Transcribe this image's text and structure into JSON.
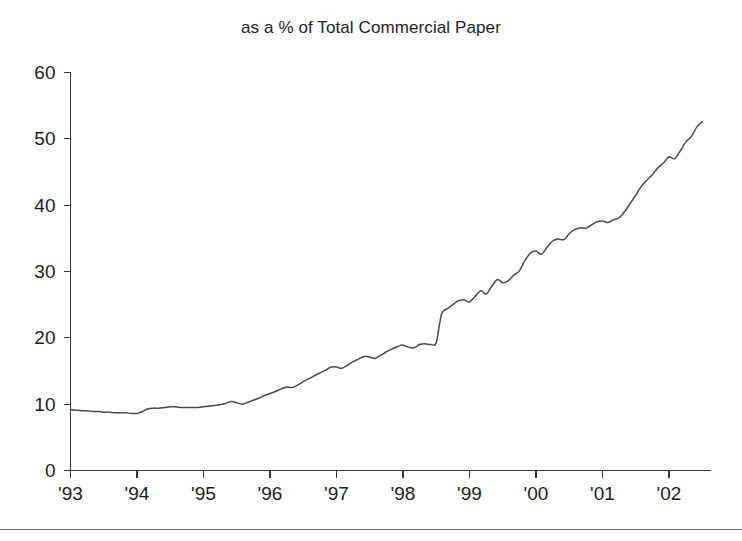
{
  "chart_data": {
    "type": "line",
    "title": "as a % of Total Commercial Paper",
    "subtitle": "",
    "xlabel": "",
    "ylabel": "",
    "grid": false,
    "legend": "none",
    "ylim": [
      0,
      60
    ],
    "xlim": [
      1993.0,
      2002.6
    ],
    "yticks": [
      0,
      10,
      20,
      30,
      40,
      50,
      60
    ],
    "ytick_labels": [
      "0",
      "10",
      "20",
      "30",
      "40",
      "50",
      "60"
    ],
    "xticks": [
      1993,
      1994,
      1995,
      1996,
      1997,
      1998,
      1999,
      2000,
      2001,
      2002
    ],
    "xtick_labels": [
      "'93",
      "'94",
      "'95",
      "'96",
      "'97",
      "'98",
      "'99",
      "'00",
      "'01",
      "'02"
    ],
    "line_color": "#4a4a4a",
    "axis_color": "#3a3a3a",
    "series": [
      {
        "name": "Asset-backed commercial paper as a % of total commercial paper",
        "x": [
          1993.0,
          1993.08,
          1993.17,
          1993.25,
          1993.33,
          1993.42,
          1993.5,
          1993.58,
          1993.67,
          1993.75,
          1993.83,
          1993.92,
          1994.0,
          1994.08,
          1994.17,
          1994.25,
          1994.33,
          1994.42,
          1994.5,
          1994.58,
          1994.67,
          1994.75,
          1994.83,
          1994.92,
          1995.0,
          1995.08,
          1995.17,
          1995.25,
          1995.33,
          1995.42,
          1995.5,
          1995.58,
          1995.67,
          1995.75,
          1995.83,
          1995.92,
          1996.0,
          1996.08,
          1996.17,
          1996.25,
          1996.33,
          1996.42,
          1996.5,
          1996.58,
          1996.67,
          1996.75,
          1996.83,
          1996.92,
          1997.0,
          1997.08,
          1997.17,
          1997.25,
          1997.33,
          1997.42,
          1997.5,
          1997.58,
          1997.67,
          1997.75,
          1997.83,
          1997.92,
          1998.0,
          1998.08,
          1998.17,
          1998.25,
          1998.33,
          1998.42,
          1998.5,
          1998.58,
          1998.67,
          1998.75,
          1998.83,
          1998.92,
          1999.0,
          1999.08,
          1999.17,
          1999.25,
          1999.33,
          1999.42,
          1999.5,
          1999.58,
          1999.67,
          1999.75,
          1999.83,
          1999.92,
          2000.0,
          2000.08,
          2000.17,
          2000.25,
          2000.33,
          2000.42,
          2000.5,
          2000.58,
          2000.67,
          2000.75,
          2000.83,
          2000.92,
          2001.0,
          2001.08,
          2001.17,
          2001.25,
          2001.33,
          2001.42,
          2001.5,
          2001.58,
          2001.67,
          2001.75,
          2001.83,
          2001.92,
          2002.0,
          2002.08,
          2002.17,
          2002.25,
          2002.33,
          2002.42,
          2002.5
        ],
        "values": [
          9.2,
          9.1,
          9.0,
          9.0,
          8.9,
          8.9,
          8.8,
          8.8,
          8.7,
          8.7,
          8.7,
          8.6,
          8.6,
          8.9,
          9.3,
          9.4,
          9.4,
          9.5,
          9.6,
          9.6,
          9.5,
          9.5,
          9.5,
          9.5,
          9.6,
          9.7,
          9.8,
          9.9,
          10.1,
          10.4,
          10.2,
          10.0,
          10.3,
          10.6,
          10.9,
          11.3,
          11.6,
          11.9,
          12.3,
          12.6,
          12.5,
          12.9,
          13.4,
          13.8,
          14.3,
          14.7,
          15.1,
          15.6,
          15.6,
          15.4,
          15.9,
          16.4,
          16.8,
          17.2,
          17.1,
          16.9,
          17.4,
          17.9,
          18.3,
          18.7,
          18.9,
          18.6,
          18.5,
          19.0,
          19.1,
          19.0,
          19.3,
          23.6,
          24.4,
          25.0,
          25.6,
          25.7,
          25.4,
          26.2,
          27.1,
          26.6,
          27.7,
          28.8,
          28.3,
          28.6,
          29.5,
          30.1,
          31.6,
          32.8,
          33.1,
          32.6,
          33.7,
          34.6,
          34.9,
          34.8,
          35.7,
          36.3,
          36.6,
          36.5,
          37.0,
          37.5,
          37.6,
          37.4,
          37.8,
          38.1,
          39.0,
          40.3,
          41.5,
          42.8,
          43.8,
          44.6,
          45.6,
          46.4,
          47.3,
          47.0,
          48.2,
          49.5,
          50.3,
          51.8,
          52.6
        ]
      }
    ]
  },
  "footer": {
    "rule": ""
  }
}
